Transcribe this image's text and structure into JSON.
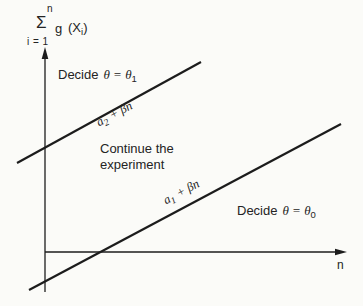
{
  "colors": {
    "background": "#fbfbf8",
    "line": "#1c1c1c",
    "text": "#242424"
  },
  "ylabel_expr": {
    "upper_limit": "n",
    "sigma": "Σ",
    "lower_limit": "i = 1",
    "function": "g",
    "arg_open": "(X",
    "arg_subscript": "i",
    "arg_close": ")"
  },
  "regions": {
    "decide_upper": {
      "word": "Decide",
      "symbols": "θ = θ",
      "subscript": "1"
    },
    "continue": {
      "line1": "Continue the",
      "line2": "experiment"
    },
    "decide_lower": {
      "word": "Decide",
      "symbols": "θ = θ",
      "subscript": "0"
    }
  },
  "boundary_labels": {
    "upper": {
      "coef": "a",
      "subscript": "2",
      "slope_term": "+ βn"
    },
    "lower": {
      "coef": "a",
      "subscript": "1",
      "slope_term": "+ βn"
    }
  },
  "axes": {
    "x_label": "n"
  }
}
